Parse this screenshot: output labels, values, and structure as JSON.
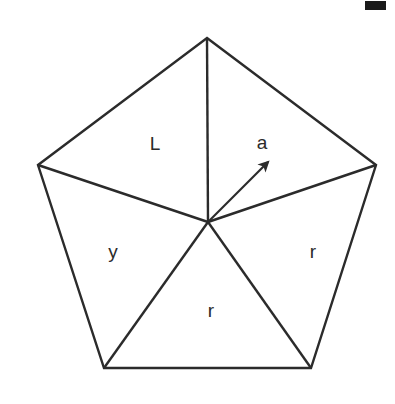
{
  "figure": {
    "shape_name": "regular-pentagon",
    "background_color": "#ffffff",
    "stroke_color": "#2b2b2b",
    "label_color": "#2b2b2b",
    "stroke_width": 2.4,
    "viewbox": "0 0 395 404"
  },
  "geometry": {
    "center": {
      "x": 208,
      "y": 222
    },
    "vertices": [
      {
        "name": "top",
        "x": 207,
        "y": 38
      },
      {
        "name": "upper-right",
        "x": 376,
        "y": 165
      },
      {
        "name": "lower-right",
        "x": 311,
        "y": 368
      },
      {
        "name": "lower-left",
        "x": 104,
        "y": 368
      },
      {
        "name": "upper-left",
        "x": 38,
        "y": 165
      }
    ],
    "outline_path": "M 207 38 L 376 165 L 311 368 L 104 368 L 38 165 Z",
    "radii": [
      {
        "name": "radius-to-top",
        "x1": 208,
        "y1": 222,
        "x2": 207,
        "y2": 38
      },
      {
        "name": "radius-to-upper-right",
        "x1": 208,
        "y1": 222,
        "x2": 376,
        "y2": 165
      },
      {
        "name": "radius-to-lower-right",
        "x1": 208,
        "y1": 222,
        "x2": 311,
        "y2": 368
      },
      {
        "name": "radius-to-lower-left",
        "x1": 208,
        "y1": 222,
        "x2": 104,
        "y2": 368
      },
      {
        "name": "radius-to-upper-left",
        "x1": 208,
        "y1": 222,
        "x2": 38,
        "y2": 165
      }
    ],
    "apothem_arrow": {
      "name": "apothem-arrow",
      "x1": 208,
      "y1": 222,
      "x2": 270,
      "y2": 160,
      "label": "a"
    }
  },
  "labels": [
    {
      "id": "label-L",
      "text": "L",
      "x": 155,
      "y": 143,
      "describes": "side-length-upper-left-triangle"
    },
    {
      "id": "label-a",
      "text": "a",
      "x": 262,
      "y": 142,
      "describes": "apothem"
    },
    {
      "id": "label-y",
      "text": "y",
      "x": 113,
      "y": 251,
      "describes": "left-triangle"
    },
    {
      "id": "label-r-right",
      "text": "r",
      "x": 313,
      "y": 251,
      "describes": "radius-right-triangle"
    },
    {
      "id": "label-r-bottom",
      "text": "r",
      "x": 211,
      "y": 310,
      "describes": "radius-bottom-triangle"
    }
  ],
  "corner_mark": {
    "name": "corner-crop-mark",
    "x": 365,
    "y": 1,
    "width": 21,
    "height": 9,
    "color": "#1a1a1a"
  }
}
